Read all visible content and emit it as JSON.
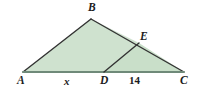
{
  "figure": {
    "kind": "geometry-diagram",
    "background_color": "#ffffff",
    "fill_color": "#cfe2cf",
    "fill_color_secondary": "#c9dfc9",
    "stroke_color": "#333333",
    "base_stroke_color": "#6f8a79",
    "label_color": "#1c1c1c",
    "stroke_width": 1.4,
    "vertices": {
      "A": {
        "label": "A",
        "x": 23,
        "y": 72
      },
      "B": {
        "label": "B",
        "x": 91,
        "y": 19
      },
      "C": {
        "label": "C",
        "x": 184,
        "y": 72
      },
      "D": {
        "label": "D",
        "x": 104,
        "y": 72
      },
      "E": {
        "label": "E",
        "x": 139,
        "y": 43
      }
    },
    "segments": [
      {
        "name": "AB",
        "from": "A",
        "to": "B"
      },
      {
        "name": "BC",
        "from": "B",
        "to": "C"
      },
      {
        "name": "AC",
        "from": "A",
        "to": "C"
      },
      {
        "name": "DE",
        "from": "D",
        "to": "E"
      }
    ],
    "side_measures": [
      {
        "name": "AD",
        "label": "x",
        "italic": true,
        "on_segment": "AC"
      },
      {
        "name": "DC",
        "label": "14",
        "italic": false,
        "on_segment": "AC"
      }
    ]
  }
}
